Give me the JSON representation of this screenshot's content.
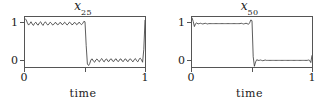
{
  "figure": {
    "background": "#ffffff",
    "line_color": "#333333",
    "axis_color": "#555555"
  },
  "chart_data": [
    {
      "type": "line",
      "title": "x_25",
      "title_base": "x",
      "title_sub": "25",
      "xlabel": "time",
      "ylabel": "",
      "xlim": [
        0,
        1
      ],
      "ylim": [
        -0.18,
        1.18
      ],
      "grid": false,
      "legend": null,
      "xticks": [
        0,
        0.5,
        1
      ],
      "xticklabels": [
        "0",
        "",
        "1"
      ],
      "yticks": [
        0,
        1
      ],
      "yticklabels": [
        "0",
        "1"
      ],
      "description": "Noisy square wave: high near 1 from t=0 to t=0.5, drops to near 0 from t=0.5 to t=1, with small rapid fluctuations throughout",
      "x": [
        0.0,
        0.01,
        0.02,
        0.03,
        0.04,
        0.05,
        0.06,
        0.07,
        0.08,
        0.09,
        0.1,
        0.11,
        0.12,
        0.13,
        0.14,
        0.15,
        0.16,
        0.17,
        0.18,
        0.19,
        0.2,
        0.21,
        0.22,
        0.23,
        0.24,
        0.25,
        0.26,
        0.27,
        0.28,
        0.29,
        0.3,
        0.31,
        0.32,
        0.33,
        0.34,
        0.35,
        0.36,
        0.37,
        0.38,
        0.39,
        0.4,
        0.41,
        0.42,
        0.43,
        0.44,
        0.45,
        0.46,
        0.47,
        0.48,
        0.49,
        0.5,
        0.51,
        0.52,
        0.53,
        0.54,
        0.55,
        0.56,
        0.57,
        0.58,
        0.59,
        0.6,
        0.61,
        0.62,
        0.63,
        0.64,
        0.65,
        0.66,
        0.67,
        0.68,
        0.69,
        0.7,
        0.71,
        0.72,
        0.73,
        0.74,
        0.75,
        0.76,
        0.77,
        0.78,
        0.79,
        0.8,
        0.81,
        0.82,
        0.83,
        0.84,
        0.85,
        0.86,
        0.87,
        0.88,
        0.89,
        0.9,
        0.91,
        0.92,
        0.93,
        0.94,
        0.95,
        0.96,
        0.97,
        0.98,
        0.99,
        1.0
      ],
      "y": [
        1.14,
        1.1,
        1.02,
        0.96,
        1.0,
        1.05,
        0.99,
        0.95,
        1.01,
        1.04,
        0.98,
        0.96,
        1.02,
        1.05,
        0.99,
        0.95,
        1.01,
        1.05,
        1.0,
        0.96,
        0.99,
        1.04,
        1.01,
        0.96,
        0.98,
        1.03,
        1.02,
        0.97,
        0.98,
        1.03,
        1.02,
        0.97,
        0.99,
        1.04,
        1.01,
        0.96,
        0.99,
        1.04,
        1.02,
        0.97,
        0.98,
        1.03,
        1.02,
        0.97,
        0.99,
        1.04,
        1.01,
        0.97,
        1.0,
        1.06,
        1.05,
        0.4,
        -0.1,
        -0.14,
        -0.08,
        0.02,
        0.04,
        -0.02,
        -0.05,
        0.01,
        0.04,
        -0.01,
        -0.04,
        0.02,
        0.05,
        -0.01,
        -0.04,
        0.02,
        0.04,
        -0.02,
        -0.03,
        0.03,
        0.04,
        -0.02,
        -0.03,
        0.03,
        0.04,
        -0.02,
        -0.03,
        0.03,
        0.04,
        -0.02,
        -0.03,
        0.03,
        0.04,
        -0.02,
        -0.03,
        0.03,
        0.04,
        -0.01,
        -0.04,
        0.02,
        0.05,
        -0.01,
        -0.04,
        0.03,
        0.06,
        0.02,
        -0.05,
        0.3,
        1.1
      ]
    },
    {
      "type": "line",
      "title": "x_50",
      "title_base": "x",
      "title_sub": "50",
      "xlabel": "time",
      "ylabel": "",
      "xlim": [
        0,
        1
      ],
      "ylim": [
        -0.18,
        1.18
      ],
      "grid": false,
      "legend": null,
      "xticks": [
        0,
        0.5,
        1
      ],
      "xticklabels": [
        "0",
        "",
        "1"
      ],
      "yticks": [
        0,
        1
      ],
      "yticklabels": [
        "0",
        "1"
      ],
      "description": "Sharp square wave: flat at 1 from t=0 to t=0.5, drops abruptly to 0 from t=0.5 to t=1, with narrow spikes at the transitions and endpoints",
      "x": [
        0.0,
        0.01,
        0.02,
        0.03,
        0.04,
        0.05,
        0.06,
        0.07,
        0.08,
        0.09,
        0.1,
        0.11,
        0.12,
        0.13,
        0.14,
        0.15,
        0.16,
        0.17,
        0.18,
        0.19,
        0.2,
        0.21,
        0.22,
        0.23,
        0.24,
        0.25,
        0.26,
        0.27,
        0.28,
        0.29,
        0.3,
        0.31,
        0.32,
        0.33,
        0.34,
        0.35,
        0.36,
        0.37,
        0.38,
        0.39,
        0.4,
        0.41,
        0.42,
        0.43,
        0.44,
        0.45,
        0.46,
        0.47,
        0.48,
        0.49,
        0.5,
        0.51,
        0.52,
        0.53,
        0.54,
        0.55,
        0.56,
        0.57,
        0.58,
        0.59,
        0.6,
        0.61,
        0.62,
        0.63,
        0.64,
        0.65,
        0.66,
        0.67,
        0.68,
        0.69,
        0.7,
        0.71,
        0.72,
        0.73,
        0.74,
        0.75,
        0.76,
        0.77,
        0.78,
        0.79,
        0.8,
        0.81,
        0.82,
        0.83,
        0.84,
        0.85,
        0.86,
        0.87,
        0.88,
        0.89,
        0.9,
        0.91,
        0.92,
        0.93,
        0.94,
        0.95,
        0.96,
        0.97,
        0.98,
        0.99,
        1.0
      ],
      "y": [
        1.16,
        1.06,
        0.92,
        1.0,
        1.02,
        0.99,
        1.0,
        1.01,
        1.0,
        0.99,
        1.0,
        1.01,
        1.0,
        0.99,
        1.0,
        1.0,
        1.0,
        1.0,
        1.0,
        1.0,
        1.0,
        1.0,
        1.0,
        1.0,
        1.0,
        1.0,
        1.0,
        1.0,
        1.0,
        1.0,
        1.0,
        1.0,
        1.0,
        1.0,
        1.0,
        1.0,
        1.0,
        1.0,
        1.0,
        1.0,
        1.0,
        1.01,
        1.0,
        0.99,
        1.0,
        1.01,
        1.0,
        0.98,
        1.02,
        1.1,
        1.08,
        0.1,
        -0.16,
        -0.04,
        0.02,
        0.0,
        0.0,
        0.01,
        0.0,
        -0.01,
        0.0,
        0.01,
        0.0,
        0.0,
        0.0,
        0.0,
        0.0,
        0.0,
        0.0,
        0.0,
        0.0,
        0.0,
        0.0,
        0.0,
        0.0,
        0.0,
        0.0,
        0.0,
        0.0,
        0.0,
        0.0,
        0.0,
        0.0,
        0.0,
        0.0,
        0.0,
        0.0,
        0.0,
        0.0,
        0.0,
        0.0,
        0.0,
        0.0,
        0.0,
        0.0,
        0.0,
        0.0,
        0.01,
        0.0,
        -0.06,
        0.14
      ]
    }
  ]
}
